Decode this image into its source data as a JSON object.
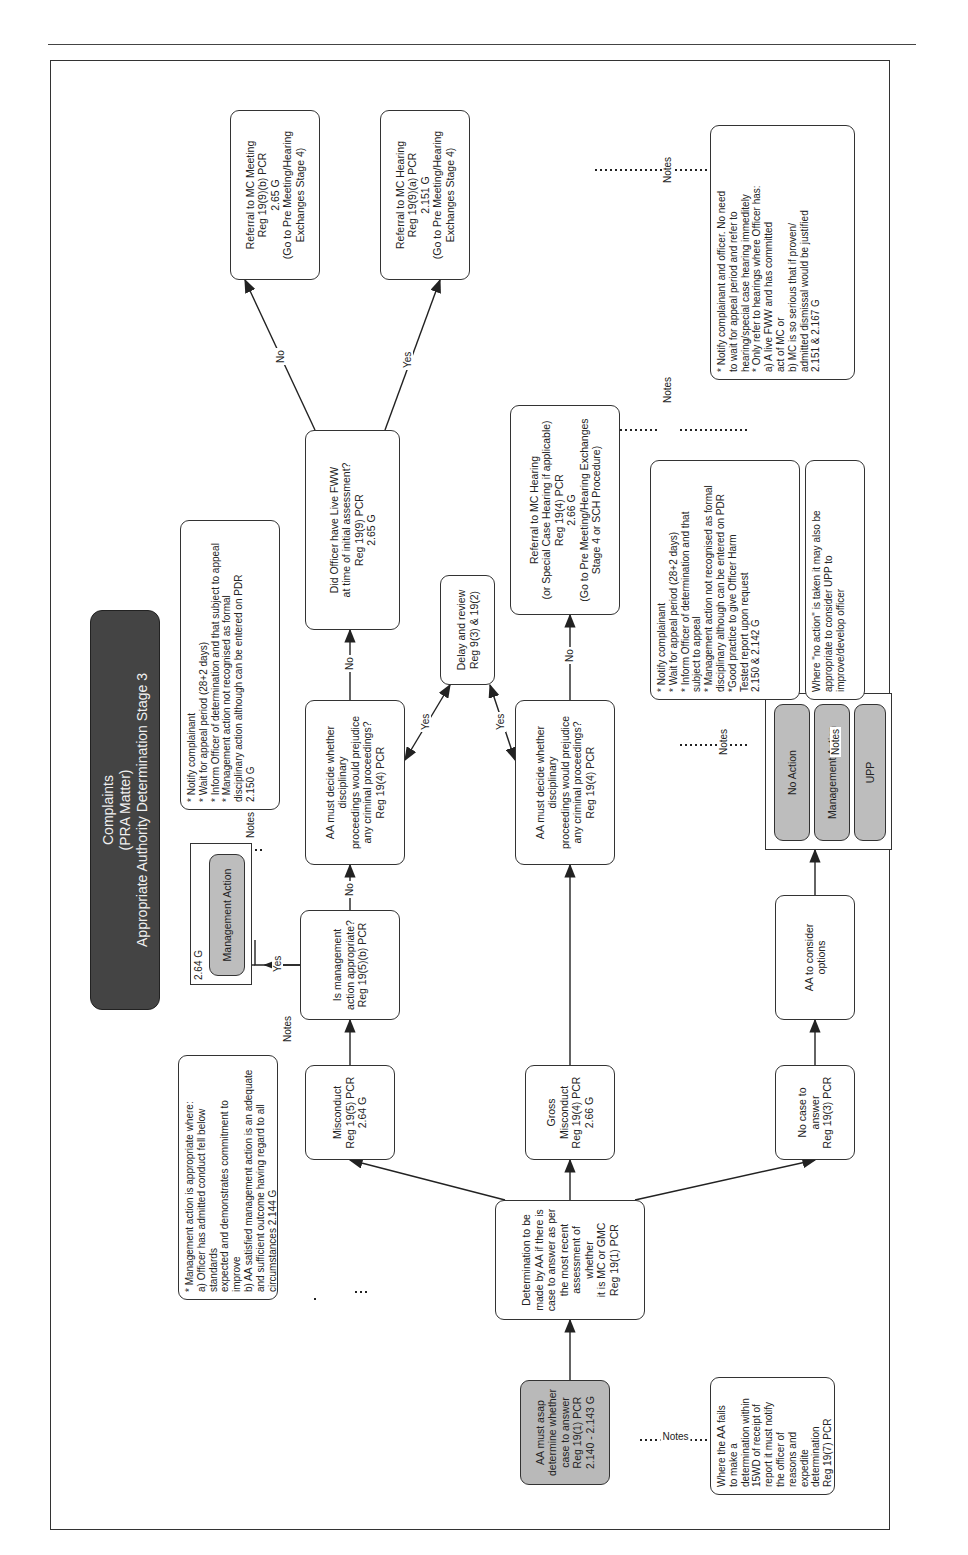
{
  "title": {
    "line1": "Complaints",
    "line2": "(PRA Matter)",
    "line3": "Appropriate Authority Determination Stage 3"
  },
  "nodes": {
    "start": "AA must asap\ndetermine whether\ncase to answer\nReg 19(1) PCR\n2.140 - 2.143 G",
    "determination": "Determination to be\nmade by AA if there is\ncase to answer as per\nthe most recent\nassessment of whether\nit is MC or GMC\nReg 19(1) PCR",
    "misconduct": "Misconduct\nReg 19(5) PCR\n2.64 G",
    "gross_misconduct": "Gross Misconduct\nReg 19(4) PCR\n2.66 G",
    "no_case": "No case to answer\nReg 19(3) PCR",
    "mgmt_appropriate": "Is management\naction appropriate?\nReg 19(5)(b) PCR",
    "aa_decide_1": "AA must decide whether disciplinary\nproceedings would prejudice\nany criminal proceedings?\nReg 19(4) PCR",
    "aa_decide_2": "AA must decide whether disciplinary\nproceedings would prejudice\nany criminal proceedings?\nReg 19(4) PCR",
    "delay_review": "Delay and review\nReg 9(3) & 19(2)",
    "live_fww": "Did Officer have Live FWW\nat time of initial assessment?\nReg 19(9) PCR\n2.65 G",
    "mc_meeting": "Referral to MC Meeting\nReg 19(9)(b) PCR\n2.65 G\n(Go to Pre Meeting/Hearing\nExchanges Stage 4)",
    "mc_hearing_fww": "Referral to MC Hearing\nReg 19(9)(a) PCR\n2.151 G\n(Go to Pre Meeting/Hearing\nExchanges Stage 4)",
    "mc_hearing_gm": "Referral to MC Hearing\n(or Special Case Hearing if applicable)\nReg 19(4) PCR\n2.66 G\n(Go to Pre Meeting/Hearing Exchanges\nStage 4 or SCH Procedure)",
    "aa_consider": "AA to consider\noptions",
    "mgmt_action_box": {
      "ref": "2.64 G",
      "label": "Management Action"
    },
    "options": [
      "No Action",
      "Management Action",
      "UPP"
    ]
  },
  "edge_labels": {
    "yes": "Yes",
    "no": "No",
    "notes": "Notes"
  },
  "notes": {
    "aa_fails": "Where the AA fails\nto make a\ndetermination within\n15WD of receipt of\nreport it must notify\nthe officer of\nreasons and\nexpedite\ndetermination\nReg 19(7) PCR",
    "mgmt_appropriate": "* Management action is appropriate where:\na) Officer has admitted conduct fell below standards\nexpected and demonstrates commitment to improve\nb) AA satisfied management action is an adequate\nand sufficient outcome having regard to all\ncircumstances 2.144 G",
    "mgmt_action": "* Notify complainant\n* Wait for appeal period (28+2 days)\n* Inform Officer of determination and that subject to appeal\n* Management action not recognised as formal\ndisciplinary action although can be entered on PDR\n2.150 G",
    "options_1": "* Notify complainant\n* Wait for appeal period (28+2 days)\n* Inform Officer of determination and that\nsubject to appeal\n* Management action not recognised as formal\ndisciplinary although can be entered on PDR\n*Good practice to give Officer Harm\nTested report upon request\n2.150 & 2.142 G",
    "options_2": "Where \"no action\" is taken it may also be\nappropriate to consider UPP to\nimprove/develop officer",
    "mc_hearing": "* Notify complainant and officer. No need\nto wait for appeal period and refer to\nhearing/special case hearing immeditely\n* Only refer to hearings where Officer has:\na) A live FWW and has committed\nact of MC or\nb) MC is so serious that if proven/\nadmitted dismissal would be justified\n2.151 & 2.167 G"
  }
}
